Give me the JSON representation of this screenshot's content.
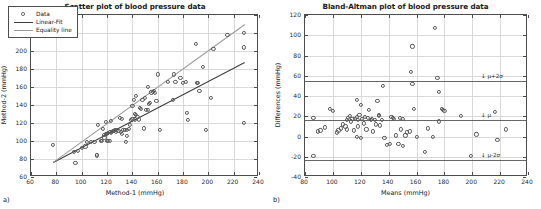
{
  "figure": {
    "panel_a_letter": "a)",
    "panel_b_letter": "b)"
  },
  "chart_data": [
    {
      "type": "scatter",
      "id": "scatter-plot",
      "title": "Scatter plot of blood pressure data",
      "xlabel": "Method-1 (mmHg)",
      "ylabel": "Method-2 (mmHg)",
      "xlim": [
        60,
        240
      ],
      "ylim": [
        60,
        240
      ],
      "xticks": [
        60,
        80,
        100,
        120,
        140,
        160,
        180,
        200,
        220,
        240
      ],
      "yticks": [
        60,
        80,
        100,
        120,
        140,
        160,
        180,
        200,
        220,
        240
      ],
      "grid": true,
      "legend_position": "upper-left",
      "legend": [
        "Data",
        "Linear-Fit",
        "Equality line"
      ],
      "series": [
        {
          "name": "Data",
          "points": [
            [
              77,
              96
            ],
            [
              95,
              76
            ],
            [
              94,
              88
            ],
            [
              97,
              89
            ],
            [
              100,
              92
            ],
            [
              103,
              94
            ],
            [
              104,
              99
            ],
            [
              107,
              99
            ],
            [
              110,
              99
            ],
            [
              112,
              84
            ],
            [
              112,
              85
            ],
            [
              113,
              118
            ],
            [
              115,
              100
            ],
            [
              116,
              100
            ],
            [
              117,
              113
            ],
            [
              118,
              104
            ],
            [
              118,
              107
            ],
            [
              119,
              108
            ],
            [
              119,
              121
            ],
            [
              120,
              100
            ],
            [
              120,
              108
            ],
            [
              121,
              100
            ],
            [
              121,
              109
            ],
            [
              122,
              100
            ],
            [
              122,
              110
            ],
            [
              123,
              109
            ],
            [
              123,
              122
            ],
            [
              124,
              110
            ],
            [
              125,
              111
            ],
            [
              126,
              112
            ],
            [
              127,
              110
            ],
            [
              128,
              112
            ],
            [
              129,
              111
            ],
            [
              130,
              126
            ],
            [
              131,
              110
            ],
            [
              132,
              108
            ],
            [
              132,
              125
            ],
            [
              133,
              112
            ],
            [
              134,
              112
            ],
            [
              135,
              99
            ],
            [
              136,
              106
            ],
            [
              136,
              112
            ],
            [
              137,
              113
            ],
            [
              138,
              118
            ],
            [
              139,
              123
            ],
            [
              140,
              125
            ],
            [
              140,
              139
            ],
            [
              141,
              146
            ],
            [
              142,
              124
            ],
            [
              142,
              130
            ],
            [
              143,
              129
            ],
            [
              143,
              150
            ],
            [
              144,
              127
            ],
            [
              145,
              124
            ],
            [
              146,
              137
            ],
            [
              147,
              136
            ],
            [
              148,
              146
            ],
            [
              149,
              114
            ],
            [
              150,
              148
            ],
            [
              151,
              135
            ],
            [
              152,
              135
            ],
            [
              152,
              160
            ],
            [
              153,
              141
            ],
            [
              154,
              142
            ],
            [
              155,
              154
            ],
            [
              156,
              155
            ],
            [
              157,
              156
            ],
            [
              158,
              153
            ],
            [
              159,
              145
            ],
            [
              160,
              174
            ],
            [
              162,
              112
            ],
            [
              168,
              166
            ],
            [
              172,
              146
            ],
            [
              173,
              174
            ],
            [
              174,
              166
            ],
            [
              178,
              170
            ],
            [
              180,
              165
            ],
            [
              182,
              166
            ],
            [
              183,
              131
            ],
            [
              184,
              123
            ],
            [
              190,
              208
            ],
            [
              191,
              165
            ],
            [
              192,
              165
            ],
            [
              193,
              156
            ],
            [
              196,
              182
            ],
            [
              198,
              112
            ],
            [
              202,
              148
            ],
            [
              204,
              202
            ],
            [
              215,
              218
            ],
            [
              228,
              120
            ],
            [
              228,
              204
            ],
            [
              228,
              220
            ]
          ]
        },
        {
          "name": "Linear-Fit",
          "line": {
            "x1": 77,
            "y1": 77,
            "x2": 228,
            "y2": 188
          }
        },
        {
          "name": "Equality line",
          "line": {
            "x1": 77,
            "y1": 77,
            "x2": 228,
            "y2": 230
          }
        }
      ]
    },
    {
      "type": "scatter",
      "id": "bland-altman-plot",
      "title": "Bland-Altman plot of blood pressure data",
      "xlabel": "Means (mmHg)",
      "ylabel": "Differences (mmHg)",
      "xlim": [
        80,
        240
      ],
      "ylim": [
        -40,
        120
      ],
      "xticks": [
        80,
        100,
        120,
        140,
        160,
        180,
        200,
        220,
        240
      ],
      "yticks": [
        -40,
        -20,
        0,
        20,
        40,
        60,
        80,
        100,
        120
      ],
      "grid": true,
      "reference_lines": [
        {
          "label": "↓ μ+2σ",
          "value": 55
        },
        {
          "label": "↓ μ",
          "value": 16
        },
        {
          "label": "↓ μ-2σ",
          "value": -23
        }
      ],
      "series": [
        {
          "name": "Differences",
          "points": [
            [
              86,
              18
            ],
            [
              86,
              -19
            ],
            [
              89,
              5
            ],
            [
              91,
              6
            ],
            [
              94,
              9
            ],
            [
              98,
              27
            ],
            [
              100,
              25
            ],
            [
              103,
              4
            ],
            [
              104,
              6
            ],
            [
              106,
              8
            ],
            [
              107,
              12
            ],
            [
              109,
              10
            ],
            [
              110,
              16
            ],
            [
              110,
              7
            ],
            [
              111,
              18
            ],
            [
              112,
              20
            ],
            [
              113,
              15
            ],
            [
              114,
              17
            ],
            [
              115,
              6
            ],
            [
              116,
              17
            ],
            [
              117,
              36
            ],
            [
              117,
              19
            ],
            [
              117,
              0
            ],
            [
              118,
              16
            ],
            [
              118,
              10
            ],
            [
              119,
              21
            ],
            [
              120,
              31
            ],
            [
              120,
              -1
            ],
            [
              121,
              17
            ],
            [
              122,
              13
            ],
            [
              123,
              19
            ],
            [
              124,
              7
            ],
            [
              125,
              18
            ],
            [
              126,
              26
            ],
            [
              127,
              16
            ],
            [
              128,
              17
            ],
            [
              129,
              5
            ],
            [
              130,
              16
            ],
            [
              131,
              12
            ],
            [
              132,
              35
            ],
            [
              133,
              20
            ],
            [
              133,
              21
            ],
            [
              134,
              11
            ],
            [
              135,
              16
            ],
            [
              136,
              50
            ],
            [
              137,
              -1
            ],
            [
              139,
              -8
            ],
            [
              141,
              -7
            ],
            [
              142,
              19
            ],
            [
              143,
              18
            ],
            [
              144,
              17
            ],
            [
              145,
              1
            ],
            [
              147,
              -7
            ],
            [
              148,
              18
            ],
            [
              149,
              7
            ],
            [
              150,
              17
            ],
            [
              150,
              -9
            ],
            [
              152,
              1
            ],
            [
              153,
              4
            ],
            [
              155,
              5
            ],
            [
              156,
              64
            ],
            [
              157,
              52
            ],
            [
              157,
              89
            ],
            [
              158,
              27
            ],
            [
              160,
              0
            ],
            [
              166,
              -15
            ],
            [
              168,
              8
            ],
            [
              172,
              0
            ],
            [
              173,
              107
            ],
            [
              175,
              58
            ],
            [
              176,
              44
            ],
            [
              176,
              15
            ],
            [
              178,
              27
            ],
            [
              179,
              26
            ],
            [
              180,
              25
            ],
            [
              192,
              20
            ],
            [
              199,
              -19
            ],
            [
              203,
              2
            ],
            [
              216,
              24
            ],
            [
              218,
              -3
            ],
            [
              224,
              7
            ]
          ]
        }
      ]
    }
  ]
}
